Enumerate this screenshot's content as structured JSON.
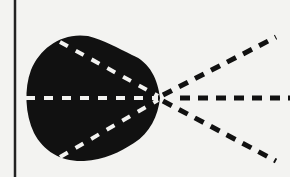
{
  "diagram": {
    "background": "#f3f3f1",
    "ink": "#111111",
    "inner_dash": "#f3f3f1",
    "border_line": {
      "x": 15,
      "y1": 0,
      "y2": 177
    },
    "blob": {
      "description": "black rounded shape (cardioid-like) with apex at right"
    },
    "convergence_point": {
      "x": 160,
      "y": 98
    },
    "rays": [
      {
        "name": "upper-ray",
        "from": [
          60,
          40
        ],
        "to": [
          278,
          35
        ]
      },
      {
        "name": "middle-ray",
        "from": [
          25,
          98
        ],
        "to": [
          290,
          98
        ]
      },
      {
        "name": "lower-ray",
        "from": [
          62,
          158
        ],
        "to": [
          278,
          162
        ]
      }
    ]
  }
}
